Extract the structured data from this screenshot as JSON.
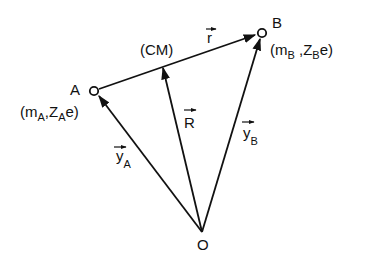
{
  "diagram": {
    "points": {
      "A": {
        "label": "A",
        "x": 94,
        "y": 91
      },
      "B": {
        "label": "B",
        "x": 262,
        "y": 33
      },
      "O": {
        "label": "O",
        "x": 202,
        "y": 232
      },
      "CM": {
        "label": "(CM)",
        "x": 162,
        "y": 66
      }
    },
    "particle_A": {
      "open": "(m",
      "m_sub": "A",
      "comma": ",Z",
      "z_sub": "A",
      "tail": "e)"
    },
    "particle_B": {
      "open": "(m",
      "m_sub": "B",
      "comma": " ,Z",
      "z_sub": "B",
      "tail": "e)"
    },
    "vectors": {
      "r": {
        "label": "r",
        "from": "A",
        "to": "B"
      },
      "R": {
        "label": "R",
        "from": "O",
        "to": "CM"
      },
      "yA": {
        "label": "y",
        "sub": "A",
        "from": "O",
        "to": "A"
      },
      "yB": {
        "label": "y",
        "sub": "B",
        "from": "O",
        "to": "B"
      }
    }
  }
}
